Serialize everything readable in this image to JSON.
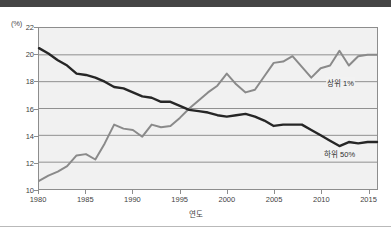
{
  "figure": {
    "y_unit_caption": "(%)",
    "x_axis_title": "연도",
    "top_band_color": "#454545",
    "plot_background": "#f1f1f1",
    "grid_color": "#8f8f8f",
    "axis_color": "#8d8d8d"
  },
  "annotations": {
    "top1_label": "상위 1%",
    "bottom50_label": "하위 50%"
  },
  "chart_data": {
    "type": "line",
    "title": "",
    "subtitle": "",
    "xlabel": "연도",
    "ylabel": "(%)",
    "xlim": [
      1980,
      2016
    ],
    "ylim": [
      10,
      22
    ],
    "ytick_values": [
      10,
      12,
      14,
      16,
      18,
      20,
      22
    ],
    "ytick_labels": [
      "10",
      "12",
      "14",
      "16",
      "18",
      "20",
      "22"
    ],
    "xtick_values": [
      1980,
      1985,
      1990,
      1995,
      2000,
      2005,
      2010,
      2015
    ],
    "xtick_labels": [
      "1980",
      "1985",
      "1990",
      "1995",
      "2000",
      "2005",
      "2010",
      "2015"
    ],
    "grid": "horizontal",
    "legend_position": "inline-annotation",
    "x": [
      1980,
      1981,
      1982,
      1983,
      1984,
      1985,
      1986,
      1987,
      1988,
      1989,
      1990,
      1991,
      1992,
      1993,
      1994,
      1995,
      1996,
      1997,
      1998,
      1999,
      2000,
      2001,
      2002,
      2003,
      2004,
      2005,
      2006,
      2007,
      2008,
      2009,
      2010,
      2011,
      2012,
      2013,
      2014,
      2015,
      2016
    ],
    "series": [
      {
        "name": "상위 1%",
        "color": "#8a8a8a",
        "values": [
          10.6,
          11.0,
          11.3,
          11.7,
          12.5,
          12.6,
          12.2,
          13.4,
          14.8,
          14.5,
          14.4,
          13.9,
          14.8,
          14.6,
          14.7,
          15.3,
          16.0,
          16.6,
          17.2,
          17.7,
          18.6,
          17.8,
          17.2,
          17.4,
          18.4,
          19.4,
          19.5,
          19.9,
          19.1,
          18.3,
          19.0,
          19.2,
          20.3,
          19.2,
          19.9,
          20.0,
          20.0
        ]
      },
      {
        "name": "하위 50%",
        "color": "#262626",
        "values": [
          20.5,
          20.1,
          19.6,
          19.2,
          18.6,
          18.5,
          18.3,
          18.0,
          17.6,
          17.5,
          17.2,
          16.9,
          16.8,
          16.5,
          16.5,
          16.2,
          15.9,
          15.8,
          15.7,
          15.5,
          15.4,
          15.5,
          15.6,
          15.4,
          15.1,
          14.7,
          14.8,
          14.8,
          14.8,
          14.4,
          14.0,
          13.6,
          13.2,
          13.5,
          13.4,
          13.5,
          13.5
        ]
      }
    ]
  }
}
